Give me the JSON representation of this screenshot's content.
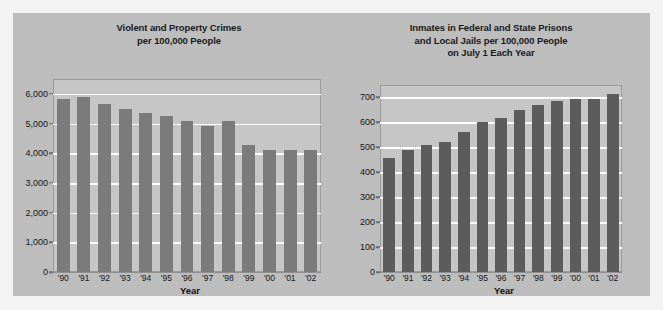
{
  "figure": {
    "background_color": "#f3f3f3",
    "panel_color": "#bdbdbd",
    "plot_color": "#c6c6c6",
    "gridline_color": "#ffffff"
  },
  "chart_data": [
    {
      "type": "bar",
      "id": "violent-and-property-crimes",
      "title": "Violent and Property Crimes\nper 100,000 People",
      "title_lines": [
        "Violent and Property Crimes",
        "per 100,000 People"
      ],
      "xlabel": "Year",
      "ylabel": "",
      "categories": [
        "'90",
        "'91",
        "'92",
        "'93",
        "'94",
        "'95",
        "'96",
        "'97",
        "'98",
        "'99",
        "'00",
        "'01",
        "'02"
      ],
      "values": [
        5820,
        5900,
        5660,
        5490,
        5370,
        5270,
        5080,
        4930,
        5090,
        4270,
        4120,
        4120,
        4120
      ],
      "ylim": [
        0,
        6500
      ],
      "yticks": [
        0,
        1000,
        2000,
        3000,
        4000,
        5000,
        6000
      ],
      "ytick_labels": [
        "0",
        "1,000",
        "2,000",
        "3,000",
        "4,000",
        "5,000",
        "6,000"
      ],
      "grid": true,
      "legend": false,
      "bar_color": "#7b7b7b"
    },
    {
      "type": "bar",
      "id": "inmates-per-100000",
      "title": "Inmates in Federal and State Prisons\nand Local Jails per 100,000 People\non July 1 Each Year",
      "title_lines": [
        "Inmates in Federal and State Prisons",
        "and Local Jails per 100,000 People",
        "on July 1 Each Year"
      ],
      "xlabel": "Year",
      "ylabel": "",
      "categories": [
        "'90",
        "'91",
        "'92",
        "'93",
        "'94",
        "'95",
        "'96",
        "'97",
        "'98",
        "'99",
        "'00",
        "'01",
        "'02"
      ],
      "values": [
        458,
        488,
        508,
        522,
        560,
        600,
        618,
        648,
        670,
        685,
        695,
        695,
        715
      ],
      "ylim": [
        0,
        750
      ],
      "yticks": [
        0,
        100,
        200,
        300,
        400,
        500,
        600,
        700
      ],
      "ytick_labels": [
        "0",
        "100",
        "200",
        "300",
        "400",
        "500",
        "600",
        "700"
      ],
      "grid": true,
      "legend": false,
      "bar_color": "#5c5c5c"
    }
  ]
}
